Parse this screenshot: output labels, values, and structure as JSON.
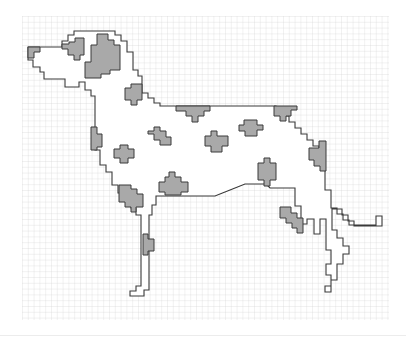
{
  "figure": {
    "grid": {
      "x": 22,
      "y": 16,
      "width": 367,
      "height": 304,
      "cell": 5.8,
      "line_color": "#cfcfcf",
      "major_color": "#bdbdbd"
    },
    "colors": {
      "outline": "#3a3a3a",
      "spot_fill": "#a9a9a9",
      "spot_stroke": "#3a3a3a",
      "background": "#ffffff"
    },
    "dog_outline": [
      [
        44,
        47
      ],
      [
        62,
        47
      ],
      [
        62,
        41
      ],
      [
        68,
        41
      ],
      [
        68,
        35
      ],
      [
        74,
        35
      ],
      [
        74,
        31
      ],
      [
        115,
        31
      ],
      [
        115,
        35
      ],
      [
        121,
        35
      ],
      [
        121,
        41
      ],
      [
        127,
        41
      ],
      [
        127,
        52
      ],
      [
        133,
        52
      ],
      [
        133,
        70
      ],
      [
        138,
        70
      ],
      [
        138,
        76
      ],
      [
        142,
        76
      ],
      [
        142,
        93
      ],
      [
        148,
        93
      ],
      [
        148,
        98
      ],
      [
        154,
        98
      ],
      [
        154,
        103
      ],
      [
        160,
        103
      ],
      [
        160,
        106
      ],
      [
        270,
        106
      ],
      [
        276,
        106
      ],
      [
        276,
        110
      ],
      [
        283,
        110
      ],
      [
        283,
        116
      ],
      [
        289,
        116
      ],
      [
        289,
        122
      ],
      [
        295,
        122
      ],
      [
        295,
        128
      ],
      [
        301,
        128
      ],
      [
        301,
        134
      ],
      [
        307,
        134
      ],
      [
        307,
        140
      ],
      [
        313,
        140
      ],
      [
        313,
        146
      ],
      [
        319,
        146
      ],
      [
        319,
        152
      ],
      [
        325,
        152
      ],
      [
        325,
        190
      ],
      [
        331,
        190
      ],
      [
        331,
        208
      ],
      [
        337,
        208
      ],
      [
        337,
        214
      ],
      [
        343,
        214
      ],
      [
        343,
        220
      ],
      [
        349,
        220
      ],
      [
        349,
        225
      ],
      [
        376,
        225
      ],
      [
        376,
        216
      ],
      [
        382,
        216
      ],
      [
        382,
        226
      ],
      [
        354,
        226
      ],
      [
        354,
        221
      ],
      [
        348,
        221
      ],
      [
        348,
        215
      ],
      [
        342,
        215
      ],
      [
        342,
        209
      ],
      [
        332,
        209
      ],
      [
        332,
        230
      ],
      [
        337,
        230
      ],
      [
        337,
        238
      ],
      [
        343,
        238
      ],
      [
        343,
        246
      ],
      [
        349,
        246
      ],
      [
        349,
        254
      ],
      [
        343,
        254
      ],
      [
        343,
        264
      ],
      [
        337,
        264
      ],
      [
        337,
        280
      ],
      [
        331,
        280
      ],
      [
        331,
        292
      ],
      [
        325,
        292
      ],
      [
        325,
        286
      ],
      [
        331,
        286
      ],
      [
        331,
        275
      ],
      [
        326,
        275
      ],
      [
        326,
        264
      ],
      [
        331,
        264
      ],
      [
        331,
        250
      ],
      [
        326,
        250
      ],
      [
        326,
        219
      ],
      [
        320,
        219
      ],
      [
        320,
        234
      ],
      [
        314,
        234
      ],
      [
        314,
        219
      ],
      [
        307,
        219
      ],
      [
        307,
        224
      ],
      [
        301,
        224
      ],
      [
        301,
        206
      ],
      [
        295,
        206
      ],
      [
        295,
        188
      ],
      [
        270,
        188
      ],
      [
        266,
        184
      ],
      [
        245,
        184
      ],
      [
        230,
        190
      ],
      [
        215,
        196
      ],
      [
        200,
        196
      ],
      [
        186,
        196
      ],
      [
        160,
        196
      ],
      [
        156,
        196
      ],
      [
        156,
        205
      ],
      [
        152,
        205
      ],
      [
        152,
        215
      ],
      [
        149,
        215
      ],
      [
        149,
        290
      ],
      [
        144,
        290
      ],
      [
        144,
        296
      ],
      [
        130,
        296
      ],
      [
        130,
        291
      ],
      [
        136,
        291
      ],
      [
        136,
        286
      ],
      [
        141,
        286
      ],
      [
        141,
        215
      ],
      [
        136,
        215
      ],
      [
        136,
        208
      ],
      [
        131,
        208
      ],
      [
        131,
        200
      ],
      [
        126,
        200
      ],
      [
        126,
        193
      ],
      [
        118,
        193
      ],
      [
        118,
        185
      ],
      [
        112,
        185
      ],
      [
        112,
        172
      ],
      [
        106,
        172
      ],
      [
        106,
        165
      ],
      [
        100,
        165
      ],
      [
        100,
        150
      ],
      [
        95,
        150
      ],
      [
        95,
        96
      ],
      [
        91,
        96
      ],
      [
        91,
        90
      ],
      [
        85,
        90
      ],
      [
        85,
        82
      ],
      [
        79,
        82
      ],
      [
        79,
        87
      ],
      [
        65,
        87
      ],
      [
        65,
        79
      ],
      [
        44,
        79
      ],
      [
        44,
        72
      ],
      [
        40,
        72
      ],
      [
        40,
        67
      ],
      [
        33,
        67
      ],
      [
        33,
        60
      ],
      [
        28,
        60
      ],
      [
        28,
        47
      ]
    ],
    "spots": [
      {
        "name": "ear-spot-muzzle",
        "points": [
          [
            28,
            47
          ],
          [
            40,
            47
          ],
          [
            40,
            52
          ],
          [
            34,
            52
          ],
          [
            34,
            58
          ],
          [
            28,
            58
          ]
        ]
      },
      {
        "name": "head-spot-eye",
        "points": [
          [
            69,
            42
          ],
          [
            75,
            42
          ],
          [
            75,
            38
          ],
          [
            84,
            38
          ],
          [
            84,
            55
          ],
          [
            80,
            55
          ],
          [
            80,
            60
          ],
          [
            74,
            60
          ],
          [
            74,
            55
          ],
          [
            68,
            55
          ],
          [
            68,
            49
          ],
          [
            62,
            49
          ],
          [
            62,
            44
          ],
          [
            69,
            44
          ]
        ]
      },
      {
        "name": "ear-spot-large",
        "points": [
          [
            97,
            34
          ],
          [
            108,
            34
          ],
          [
            108,
            40
          ],
          [
            114,
            40
          ],
          [
            114,
            45
          ],
          [
            120,
            45
          ],
          [
            120,
            70
          ],
          [
            110,
            70
          ],
          [
            110,
            74
          ],
          [
            101,
            74
          ],
          [
            101,
            78
          ],
          [
            85,
            78
          ],
          [
            85,
            62
          ],
          [
            91,
            62
          ],
          [
            91,
            45
          ],
          [
            97,
            45
          ]
        ]
      },
      {
        "name": "neck-spot",
        "points": [
          [
            131,
            84
          ],
          [
            142,
            84
          ],
          [
            142,
            100
          ],
          [
            137,
            100
          ],
          [
            137,
            105
          ],
          [
            131,
            105
          ],
          [
            131,
            100
          ],
          [
            125,
            100
          ],
          [
            125,
            88
          ],
          [
            131,
            88
          ]
        ]
      },
      {
        "name": "back-spot-left",
        "points": [
          [
            176,
            106
          ],
          [
            210,
            106
          ],
          [
            210,
            111
          ],
          [
            204,
            111
          ],
          [
            204,
            116
          ],
          [
            198,
            116
          ],
          [
            198,
            122
          ],
          [
            192,
            122
          ],
          [
            192,
            116
          ],
          [
            186,
            116
          ],
          [
            186,
            111
          ],
          [
            176,
            111
          ]
        ]
      },
      {
        "name": "back-spot-right",
        "points": [
          [
            274,
            106
          ],
          [
            297,
            106
          ],
          [
            297,
            110
          ],
          [
            291,
            110
          ],
          [
            291,
            116
          ],
          [
            286,
            116
          ],
          [
            286,
            121
          ],
          [
            280,
            121
          ],
          [
            280,
            116
          ],
          [
            274,
            116
          ]
        ]
      },
      {
        "name": "chest-spot",
        "points": [
          [
            91,
            127
          ],
          [
            97,
            127
          ],
          [
            97,
            134
          ],
          [
            102,
            134
          ],
          [
            102,
            147
          ],
          [
            97,
            147
          ],
          [
            97,
            150
          ],
          [
            91,
            150
          ]
        ]
      },
      {
        "name": "shoulder-spot-small",
        "points": [
          [
            154,
            127
          ],
          [
            160,
            127
          ],
          [
            160,
            131
          ],
          [
            166,
            131
          ],
          [
            166,
            137
          ],
          [
            171,
            137
          ],
          [
            171,
            145
          ],
          [
            160,
            145
          ],
          [
            160,
            140
          ],
          [
            154,
            140
          ],
          [
            154,
            134
          ],
          [
            148,
            134
          ],
          [
            148,
            131
          ],
          [
            154,
            131
          ]
        ]
      },
      {
        "name": "body-spot-mid",
        "points": [
          [
            211,
            131
          ],
          [
            217,
            131
          ],
          [
            217,
            136
          ],
          [
            228,
            136
          ],
          [
            228,
            146
          ],
          [
            222,
            146
          ],
          [
            222,
            152
          ],
          [
            211,
            152
          ],
          [
            211,
            146
          ],
          [
            205,
            146
          ],
          [
            205,
            136
          ],
          [
            211,
            136
          ]
        ]
      },
      {
        "name": "body-spot-back",
        "points": [
          [
            244,
            120
          ],
          [
            257,
            120
          ],
          [
            257,
            125
          ],
          [
            263,
            125
          ],
          [
            263,
            130
          ],
          [
            257,
            130
          ],
          [
            257,
            136
          ],
          [
            245,
            136
          ],
          [
            245,
            131
          ],
          [
            239,
            131
          ],
          [
            239,
            125
          ],
          [
            244,
            125
          ]
        ]
      },
      {
        "name": "chest-spot-lower",
        "points": [
          [
            120,
            145
          ],
          [
            128,
            145
          ],
          [
            128,
            149
          ],
          [
            134,
            149
          ],
          [
            134,
            158
          ],
          [
            128,
            158
          ],
          [
            128,
            163
          ],
          [
            120,
            163
          ],
          [
            120,
            158
          ],
          [
            114,
            158
          ],
          [
            114,
            149
          ],
          [
            120,
            149
          ]
        ]
      },
      {
        "name": "belly-spot",
        "points": [
          [
            169,
            172
          ],
          [
            175,
            172
          ],
          [
            175,
            177
          ],
          [
            181,
            177
          ],
          [
            181,
            182
          ],
          [
            188,
            182
          ],
          [
            188,
            192
          ],
          [
            181,
            192
          ],
          [
            181,
            195
          ],
          [
            165,
            195
          ],
          [
            165,
            192
          ],
          [
            159,
            192
          ],
          [
            159,
            182
          ],
          [
            165,
            182
          ],
          [
            165,
            177
          ],
          [
            169,
            177
          ]
        ]
      },
      {
        "name": "hip-spot",
        "points": [
          [
            264,
            158
          ],
          [
            270,
            158
          ],
          [
            270,
            163
          ],
          [
            276,
            163
          ],
          [
            276,
            180
          ],
          [
            270,
            180
          ],
          [
            270,
            186
          ],
          [
            264,
            186
          ],
          [
            264,
            180
          ],
          [
            258,
            180
          ],
          [
            258,
            163
          ],
          [
            264,
            163
          ]
        ]
      },
      {
        "name": "rump-spot",
        "points": [
          [
            319,
            141
          ],
          [
            326,
            141
          ],
          [
            326,
            171
          ],
          [
            320,
            171
          ],
          [
            320,
            166
          ],
          [
            314,
            166
          ],
          [
            314,
            160
          ],
          [
            309,
            160
          ],
          [
            309,
            148
          ],
          [
            319,
            148
          ]
        ]
      },
      {
        "name": "foreleg-spot",
        "points": [
          [
            119,
            185
          ],
          [
            131,
            185
          ],
          [
            131,
            189
          ],
          [
            137,
            189
          ],
          [
            137,
            194
          ],
          [
            143,
            194
          ],
          [
            143,
            207
          ],
          [
            136,
            207
          ],
          [
            136,
            212
          ],
          [
            131,
            212
          ],
          [
            131,
            207
          ],
          [
            125,
            207
          ],
          [
            125,
            202
          ],
          [
            119,
            202
          ]
        ]
      },
      {
        "name": "hindleg-spot",
        "points": [
          [
            280,
            207
          ],
          [
            291,
            207
          ],
          [
            291,
            213
          ],
          [
            297,
            213
          ],
          [
            297,
            218
          ],
          [
            303,
            218
          ],
          [
            303,
            233
          ],
          [
            297,
            233
          ],
          [
            297,
            228
          ],
          [
            292,
            228
          ],
          [
            292,
            223
          ],
          [
            286,
            223
          ],
          [
            286,
            218
          ],
          [
            280,
            218
          ]
        ]
      },
      {
        "name": "foreleg-lower-spot",
        "points": [
          [
            143,
            234
          ],
          [
            148,
            234
          ],
          [
            148,
            239
          ],
          [
            154,
            239
          ],
          [
            154,
            251
          ],
          [
            148,
            251
          ],
          [
            148,
            255
          ],
          [
            143,
            255
          ]
        ]
      }
    ]
  }
}
